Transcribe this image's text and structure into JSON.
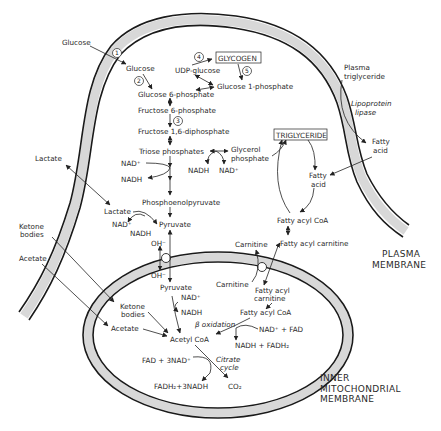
{
  "diagram": {
    "membranes": {
      "plasma": "PLASMA|MEMBRANE",
      "inner_mito": "INNER|MITOCHONDRIAL|MEMBRANE"
    },
    "step_numbers": [
      "1",
      "2",
      "3",
      "4",
      "5"
    ],
    "labels": {
      "glucose_ext": "Glucose",
      "glucose": "Glucose",
      "g6p": "Glucose 6-phosphate",
      "f6p": "Fructose 6-phosphate",
      "f16dp": "Fructose 1,6-diphosphate",
      "triose": "Triose phosphates",
      "glycerol_p1": "Glycerol",
      "glycerol_p2": "phosphate",
      "nadh_g": "NADH",
      "nad_g": "NAD⁺",
      "nad_t": "NAD⁺",
      "nadh_t": "NADH",
      "pep": "Phosphoenolpyruvate",
      "lactate_ext": "Lactate",
      "lactate": "Lactate",
      "nad_l": "NAD⁺",
      "nadh_l": "NADH",
      "pyruvate": "Pyruvate",
      "oh_top": "OH⁻",
      "oh_bottom": "OH⁻",
      "udp_glucose": "UDP-glucose",
      "glycogen": "GLYCOGEN",
      "g1p": "Glucose 1-phosphate",
      "plasma_tg1": "Plasma",
      "plasma_tg2": "triglyceride",
      "lpl1": "Lipoprotein",
      "lpl2": "lipase",
      "fa_ext1": "Fatty",
      "fa_ext2": "acid",
      "triglyceride": "TRIGLYCERIDE",
      "fa1": "Fatty",
      "fa2": "acid",
      "facoa": "Fatty acyl CoA",
      "carnitine_c": "Carnitine",
      "facarn_c": "Fatty acyl carnitine",
      "ketone_ext1": "Ketone",
      "ketone_ext2": "bodies",
      "acetate_ext": "Acetate",
      "pyruvate_m": "Pyruvate",
      "nad_m": "NAD⁺",
      "nadh_m": "NADH",
      "ketone_m1": "Ketone",
      "ketone_m2": "bodies",
      "acetate_m": "Acetate",
      "acetylcoa": "Acetyl CoA",
      "carnitine_m": "Carnitine",
      "facarn_m1": "Fatty acyl",
      "facarn_m2": "carnitine",
      "facoa_m": "Fatty acyl CoA",
      "beta_ox": "β oxidation",
      "nad_fad": "NAD⁺ + FAD",
      "nadh_fadh2": "NADH + FADH₂",
      "fad_3nad": "FAD + 3NAD⁺",
      "citrate1": "Citrate",
      "citrate2": "cycle",
      "fadh2_3nadh": "FADH₂+3NADH",
      "co2": "CO₂"
    }
  }
}
